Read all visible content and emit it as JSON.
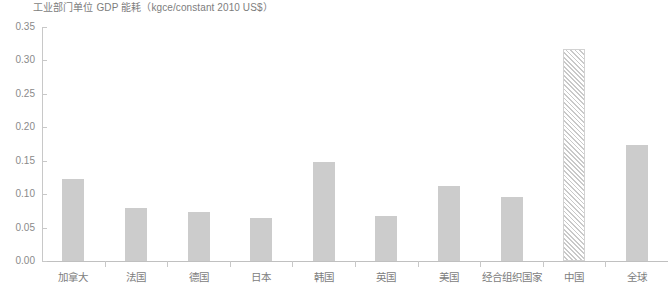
{
  "chart_data": {
    "type": "bar",
    "title": "工业部门单位 GDP 能耗（kgce/constant 2010 US$）",
    "xlabel": "",
    "ylabel": "",
    "ylim": [
      0.0,
      0.35
    ],
    "ytick_step": 0.05,
    "ytick_labels": [
      "0.00",
      "0.05",
      "0.10",
      "0.15",
      "0.20",
      "0.25",
      "0.30",
      "0.35"
    ],
    "ytick_values": [
      0.0,
      0.05,
      0.1,
      0.15,
      0.2,
      0.25,
      0.3,
      0.35
    ],
    "grid": false,
    "legend": "none",
    "bar_color": "#cccccc",
    "hatched_bar_color": "#c9c9c9",
    "axis_color": "#c8c8c8",
    "text_color": "#7d7d7d",
    "categories": [
      "加拿大",
      "法国",
      "德国",
      "日本",
      "韩国",
      "英国",
      "美国",
      "经合组织国家",
      "中国",
      "全球"
    ],
    "values": [
      0.123,
      0.079,
      0.074,
      0.065,
      0.148,
      0.067,
      0.112,
      0.096,
      0.317,
      0.174
    ],
    "hatched": [
      false,
      false,
      false,
      false,
      false,
      false,
      false,
      false,
      true,
      false
    ],
    "points": [
      {
        "label": "加拿大",
        "value": 0.123,
        "hatched": false
      },
      {
        "label": "法国",
        "value": 0.079,
        "hatched": false
      },
      {
        "label": "德国",
        "value": 0.074,
        "hatched": false
      },
      {
        "label": "日本",
        "value": 0.065,
        "hatched": false
      },
      {
        "label": "韩国",
        "value": 0.148,
        "hatched": false
      },
      {
        "label": "英国",
        "value": 0.067,
        "hatched": false
      },
      {
        "label": "美国",
        "value": 0.112,
        "hatched": false
      },
      {
        "label": "经合组织国家",
        "value": 0.096,
        "hatched": false
      },
      {
        "label": "中国",
        "value": 0.317,
        "hatched": true
      },
      {
        "label": "全球",
        "value": 0.174,
        "hatched": false
      }
    ]
  }
}
